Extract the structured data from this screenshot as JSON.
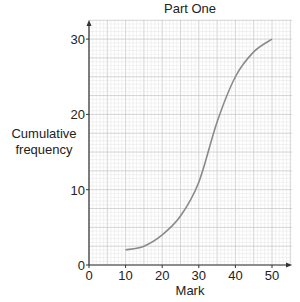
{
  "chart_data": {
    "type": "line",
    "title": "Part One",
    "xlabel": "Mark",
    "ylabel": "Cumulative frequency",
    "xlim": [
      0,
      55
    ],
    "ylim": [
      0,
      32
    ],
    "xticks": [
      0,
      10,
      20,
      30,
      40,
      50
    ],
    "yticks": [
      0,
      10,
      20,
      30
    ],
    "grid": true,
    "legend": null,
    "series": [
      {
        "name": "Cumulative frequency curve",
        "x": [
          10,
          15,
          20,
          25,
          30,
          35,
          40,
          45,
          50
        ],
        "y": [
          2,
          2.5,
          4,
          6.5,
          11,
          19,
          25,
          28.3,
          30
        ]
      }
    ],
    "colors": {
      "curve": "#8a8a8a",
      "axis": "#333333",
      "grid_major": "#c9c9c9",
      "grid_minor": "#e4e4e4"
    }
  }
}
